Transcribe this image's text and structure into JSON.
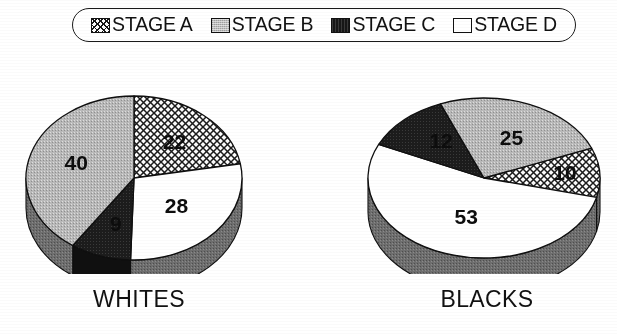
{
  "legend": {
    "items": [
      {
        "label": "STAGE A",
        "swatch": "crosshatch-swatch-icon",
        "color": "#ffffff",
        "pattern": "crosshatch"
      },
      {
        "label": "STAGE B",
        "swatch": "gray-swatch-icon",
        "color": "#bdbdbd",
        "pattern": "solid-gray"
      },
      {
        "label": "STAGE C",
        "swatch": "black-swatch-icon",
        "color": "#171717",
        "pattern": "solid-black"
      },
      {
        "label": "STAGE D",
        "swatch": "white-swatch-icon",
        "color": "#ffffff",
        "pattern": "solid-white"
      }
    ]
  },
  "charts": [
    {
      "caption": "WHITES"
    },
    {
      "caption": "BLACKS"
    }
  ],
  "chart_data": [
    {
      "type": "pie",
      "title": "WHITES",
      "categories": [
        "STAGE A",
        "STAGE B",
        "STAGE C",
        "STAGE D"
      ],
      "values": [
        22,
        40,
        9,
        28
      ],
      "labels": [
        "22",
        "40",
        "9",
        "28"
      ],
      "colors": [
        "#ffffff",
        "#bdbdbd",
        "#171717",
        "#ffffff"
      ],
      "patterns": [
        "crosshatch",
        "solid-gray",
        "solid-black",
        "solid-white"
      ],
      "units": "percent",
      "legend_position": "top",
      "three_d": true
    },
    {
      "type": "pie",
      "title": "BLACKS",
      "categories": [
        "STAGE A",
        "STAGE B",
        "STAGE C",
        "STAGE D"
      ],
      "values": [
        10,
        25,
        12,
        53
      ],
      "labels": [
        "10",
        "25",
        "12",
        "53"
      ],
      "colors": [
        "#ffffff",
        "#bdbdbd",
        "#171717",
        "#ffffff"
      ],
      "patterns": [
        "crosshatch",
        "solid-gray",
        "solid-black",
        "solid-white"
      ],
      "units": "percent",
      "legend_position": "top",
      "three_d": true
    }
  ]
}
